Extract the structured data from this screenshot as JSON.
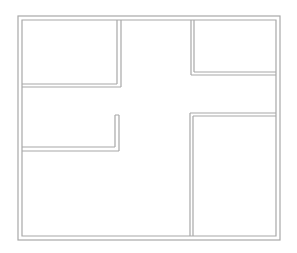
{
  "floorplan": {
    "canvas": {
      "width": 297,
      "height": 253
    },
    "wall_color": "#a8a8a8",
    "background": "#ffffff",
    "outer_wall": {
      "outer": [
        18,
        16,
        280,
        240
      ],
      "inner": [
        22,
        20,
        276,
        236
      ]
    },
    "rooms": [
      {
        "id": "room-top-left",
        "rect": [
          22,
          20,
          118,
          84
        ]
      },
      {
        "id": "room-top-right",
        "rect": [
          193,
          20,
          276,
          73
        ]
      },
      {
        "id": "room-middle-left",
        "rect": [
          22,
          87,
          116,
          148
        ]
      },
      {
        "id": "room-bottom-right",
        "rect": [
          192,
          115,
          276,
          236
        ]
      },
      {
        "id": "room-bottom-left",
        "rect": [
          22,
          151,
          190,
          236
        ]
      },
      {
        "id": "hallway",
        "rect": [
          121,
          20,
          190,
          148
        ]
      }
    ]
  }
}
